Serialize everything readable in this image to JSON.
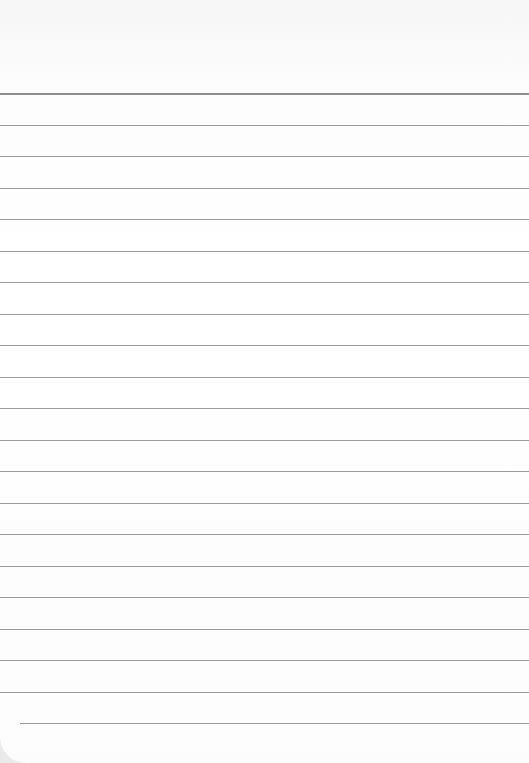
{
  "paper": {
    "kind": "blank ruled notebook paper",
    "line_count": 21,
    "first_line_y": 93,
    "line_spacing": 31.5,
    "line_color": "#8a8a8a",
    "paper_color": "#ffffff"
  }
}
